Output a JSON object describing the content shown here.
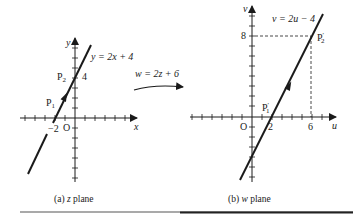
{
  "figure": {
    "left_panel": {
      "caption_prefix": "(a) ",
      "caption_var": "z",
      "caption_suffix": " plane",
      "x_axis_label": "x",
      "y_axis_label": "y",
      "origin_label": "O",
      "line_equation": "y = 2x + 4",
      "tick_label_x": "−2",
      "tick_label_y": "4",
      "point1": {
        "name": "P",
        "sub": "1"
      },
      "point2": {
        "name": "P",
        "sub": "2"
      }
    },
    "mapping": {
      "equation": "w = 2z + 6"
    },
    "right_panel": {
      "caption_prefix": "(b) ",
      "caption_var": "w",
      "caption_suffix": " plane",
      "x_axis_label": "u",
      "y_axis_label": "v",
      "origin_label": "O",
      "line_equation": "v = 2u − 4",
      "tick_label_u1": "2",
      "tick_label_u2": "6",
      "tick_label_v": "8",
      "point1": {
        "name": "P",
        "sub": "1",
        "prime": "′"
      },
      "point2": {
        "name": "P",
        "sub": "2",
        "prime": "′"
      }
    }
  }
}
